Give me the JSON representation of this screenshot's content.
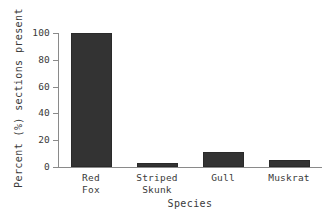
{
  "chart_data": {
    "type": "bar",
    "title": "",
    "subtitle": "",
    "xlabel": "Species",
    "ylabel": "Percent (%) sections present",
    "categories": [
      "Red\nFox",
      "Striped\nSkunk",
      "Gull",
      "Muskrat"
    ],
    "category_names": [
      "Red Fox",
      "Striped Skunk",
      "Gull",
      "Muskrat"
    ],
    "values": [
      100,
      3,
      11,
      5
    ],
    "ylim": [
      0,
      100
    ],
    "yticks": [
      0,
      20,
      40,
      60,
      80,
      100
    ],
    "ytick_labels": [
      "0",
      "20",
      "40",
      "60",
      "80",
      "100"
    ],
    "grid": false,
    "legend": "none",
    "bar_color": "#333333",
    "axis_color": "#8a8a8a",
    "background_color": "#ffffff"
  }
}
